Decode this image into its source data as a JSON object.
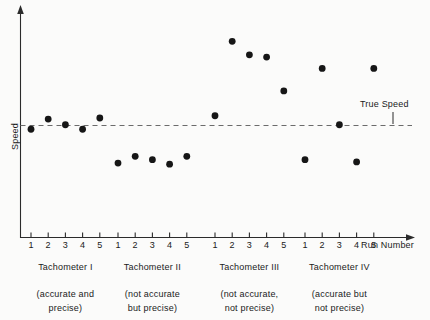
{
  "chart_data": {
    "type": "scatter",
    "title": "",
    "xlabel": "Run Number",
    "ylabel": "Speed",
    "grid": false,
    "legend_position": "none",
    "xlim": [
      0,
      22
    ],
    "ylim": [
      0,
      10
    ],
    "reference_line": {
      "label": "True Speed",
      "value": 5.0,
      "style": "dashed",
      "orientation": "horizontal"
    },
    "categories": [
      "1",
      "2",
      "3",
      "4",
      "5"
    ],
    "groups": [
      {
        "name": "Tachometer I",
        "numeral": "I",
        "description_line1": "(accurate and",
        "description_line2": "precise)",
        "x": [
          1,
          2,
          3,
          4,
          5
        ],
        "values": [
          4.8,
          5.25,
          5.0,
          4.8,
          5.3
        ]
      },
      {
        "name": "Tachometer II",
        "numeral": "II",
        "description_line1": "(not accurate",
        "description_line2": "but precise)",
        "x": [
          1,
          2,
          3,
          4,
          5
        ],
        "values": [
          3.3,
          3.6,
          3.45,
          3.25,
          3.6
        ]
      },
      {
        "name": "Tachometer III",
        "numeral": "III",
        "description_line1": "(not accurate,",
        "description_line2": "not precise)",
        "x": [
          1,
          2,
          3,
          4,
          5
        ],
        "values": [
          5.4,
          8.7,
          8.1,
          8.0,
          6.5
        ]
      },
      {
        "name": "Tachometer IV",
        "numeral": "IV",
        "description_line1": "(accurate but",
        "description_line2": "not precise)",
        "x": [
          1,
          2,
          3,
          4,
          5
        ],
        "values": [
          3.45,
          7.5,
          5.0,
          3.35,
          7.5
        ]
      }
    ]
  },
  "axes": {
    "y_label": "Speed",
    "x_label": "Run Number"
  },
  "annotations": {
    "true_speed": "True Speed"
  },
  "groups_display": [
    {
      "label": "Tachometer I",
      "desc1": "(accurate and",
      "desc2": "precise)",
      "ticks": [
        "1",
        "2",
        "3",
        "4",
        "5"
      ]
    },
    {
      "label": "Tachometer II",
      "desc1": "(not accurate",
      "desc2": "but precise)",
      "ticks": [
        "1",
        "2",
        "3",
        "4",
        "5"
      ]
    },
    {
      "label": "Tachometer III",
      "desc1": "(not accurate,",
      "desc2": "not precise)",
      "ticks": [
        "1",
        "2",
        "3",
        "4",
        "5"
      ]
    },
    {
      "label": "Tachometer IV",
      "desc1": "(accurate but",
      "desc2": "not precise)",
      "ticks": [
        "1",
        "2",
        "3",
        "4",
        "5"
      ]
    }
  ],
  "colors": {
    "marker": "#161616",
    "axis": "#2b2b2b",
    "reference_line": "#6b6b6b",
    "background": "#fbfbfa",
    "text": "#1a1a1a"
  }
}
